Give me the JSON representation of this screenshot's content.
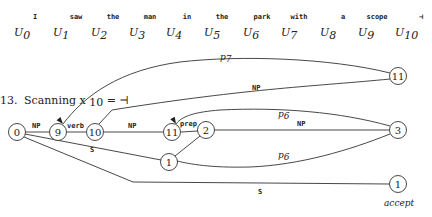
{
  "sentence": {
    "words": [
      {
        "text": "I",
        "x": 35
      },
      {
        "text": "saw",
        "x": 76
      },
      {
        "text": "the",
        "x": 113
      },
      {
        "text": "man",
        "x": 150
      },
      {
        "text": "in",
        "x": 187
      },
      {
        "text": "the",
        "x": 222
      },
      {
        "text": "park",
        "x": 262
      },
      {
        "text": "with",
        "x": 299
      },
      {
        "text": "a",
        "x": 343
      },
      {
        "text": "scope",
        "x": 377
      },
      {
        "text": "⊣",
        "x": 421
      }
    ],
    "positions": [
      {
        "sym": "U",
        "sub": "0",
        "x": 14
      },
      {
        "sym": "U",
        "sub": "1",
        "x": 53
      },
      {
        "sym": "U",
        "sub": "2",
        "x": 91
      },
      {
        "sym": "U",
        "sub": "3",
        "x": 129
      },
      {
        "sym": "U",
        "sub": "4",
        "x": 166
      },
      {
        "sym": "U",
        "sub": "5",
        "x": 204
      },
      {
        "sym": "U",
        "sub": "6",
        "x": 243
      },
      {
        "sym": "U",
        "sub": "7",
        "x": 281
      },
      {
        "sym": "U",
        "sub": "8",
        "x": 320
      },
      {
        "sym": "U",
        "sub": "9",
        "x": 358
      },
      {
        "sym": "U",
        "sub": "10",
        "x": 395
      }
    ]
  },
  "step": {
    "number": "13.",
    "label": "Scanning x",
    "sub": "10",
    "rest": " = ⊣"
  },
  "graph": {
    "nodes": [
      {
        "id": "n0",
        "label": "0",
        "x": 17,
        "y": 132
      },
      {
        "id": "n9",
        "label": "9",
        "x": 58,
        "y": 132
      },
      {
        "id": "n10",
        "label": "10",
        "x": 95,
        "y": 132
      },
      {
        "id": "n11a",
        "label": "11",
        "x": 172,
        "y": 132
      },
      {
        "id": "n2",
        "label": "2",
        "x": 206,
        "y": 130
      },
      {
        "id": "n1a",
        "label": "1",
        "x": 169,
        "y": 162
      },
      {
        "id": "n11b",
        "label": "11",
        "x": 398,
        "y": 76
      },
      {
        "id": "n3",
        "label": "3",
        "x": 398,
        "y": 130
      },
      {
        "id": "n1b",
        "label": "1",
        "x": 398,
        "y": 184
      }
    ],
    "edges": [
      {
        "id": "e-0-9",
        "label": "NP",
        "type": "mono",
        "path": "M25,132 L50,132",
        "lx": 32,
        "ly": 128,
        "arrow": false
      },
      {
        "id": "e-9-10",
        "label": "verb",
        "type": "mono",
        "path": "M66,132 L86,132",
        "lx": 67,
        "ly": 128,
        "arrow": false
      },
      {
        "id": "e-10-11",
        "label": "NP",
        "type": "mono",
        "path": "M104,132 L163,132",
        "lx": 128,
        "ly": 128,
        "arrow": false
      },
      {
        "id": "e-11-2",
        "label": "prep",
        "type": "mono",
        "path": "M181,132 L198,131",
        "lx": 180,
        "ly": 126,
        "arrow": false
      },
      {
        "id": "e-2-3",
        "label": "NP",
        "type": "mono",
        "path": "M214,130 L390,130",
        "lx": 297,
        "ly": 126,
        "arrow": false
      },
      {
        "id": "e-2-1",
        "label": "",
        "type": "none",
        "path": "M200,136 L175,156",
        "lx": 0,
        "ly": 0,
        "arrow": false
      },
      {
        "id": "e-0-1a",
        "label": "S",
        "type": "mono",
        "path": "M25,134 L161,160",
        "lx": 90,
        "ly": 152,
        "arrow": false
      },
      {
        "id": "e-0-1b",
        "label": "S",
        "type": "mono",
        "path": "M24,137 L133,182 L390,184",
        "lx": 258,
        "ly": 194,
        "arrow": false
      },
      {
        "id": "e-11b-9",
        "label": "p",
        "sub": "7",
        "type": "italic",
        "path": "M390,73 C330,58 240,55 180,62 C120,70 85,95 63,124",
        "lx": 220,
        "ly": 60,
        "arrow": true,
        "ax": 63,
        "ay": 124,
        "adir": 230
      },
      {
        "id": "e-11b-10",
        "label": "NP",
        "type": "mono",
        "path": "M390,79 C320,86 250,88 112,110 L99,124",
        "lx": 252,
        "ly": 90,
        "arrow": false
      },
      {
        "id": "e-3-11a",
        "label": "p",
        "sub": "6",
        "type": "italic",
        "path": "M390,126 C340,112 280,107 220,110 C195,112 182,116 176,124",
        "lx": 278,
        "ly": 117,
        "arrow": true,
        "ax": 176,
        "ay": 124,
        "adir": 240
      },
      {
        "id": "e-3-1a",
        "label": "p",
        "sub": "6",
        "type": "italic",
        "path": "M390,134 C350,150 300,165 250,167 C210,168 190,164 177,161",
        "lx": 278,
        "ly": 158,
        "arrow": true,
        "ax": 177,
        "ay": 161,
        "adir": 190
      }
    ],
    "accept_label": "accept",
    "accept_x": 384,
    "accept_y": 206
  }
}
